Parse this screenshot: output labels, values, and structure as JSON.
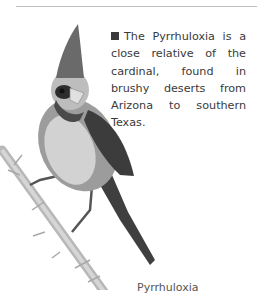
{
  "page": {
    "body_text": "The Pyrrhuloxia is a close relative of the cardinal, found in brushy deserts from Arizona to southern Texas.",
    "image_caption": "Pyrrhuloxia",
    "illustration": "pyrrhuloxia-on-thorny-branch"
  }
}
